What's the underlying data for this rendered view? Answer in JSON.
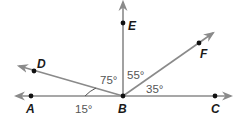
{
  "points": {
    "A": "A",
    "B": "B",
    "C": "C",
    "D": "D",
    "E": "E",
    "F": "F"
  },
  "angles": {
    "DBE": "75°",
    "EBF": "55°",
    "FBC": "35°",
    "ABD": "15°"
  },
  "colors": {
    "ray": "#8a8a8a",
    "point": "#111111",
    "angle_text": "#555555"
  }
}
